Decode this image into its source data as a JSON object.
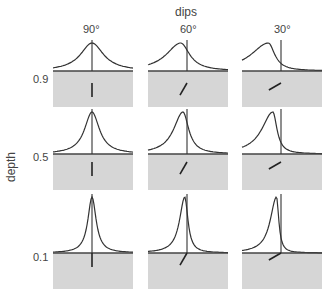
{
  "figure": {
    "column_axis_title": "dips",
    "row_axis_title": "depth",
    "columns": [
      {
        "label": "90°",
        "dip_deg": 90
      },
      {
        "label": "60°",
        "dip_deg": 60
      },
      {
        "label": "30°",
        "dip_deg": 30
      }
    ],
    "rows": [
      {
        "label": "0.9",
        "depth": 0.9,
        "peak_height": 28,
        "width": 14
      },
      {
        "label": "0.5",
        "depth": 0.5,
        "peak_height": 42,
        "width": 9
      },
      {
        "label": "0.1",
        "depth": 0.1,
        "peak_height": 56,
        "width": 5
      }
    ],
    "colors": {
      "ground_fill": "#d6d6d6",
      "curve": "#333333",
      "baseline": "#444444",
      "background": "#ffffff"
    }
  }
}
